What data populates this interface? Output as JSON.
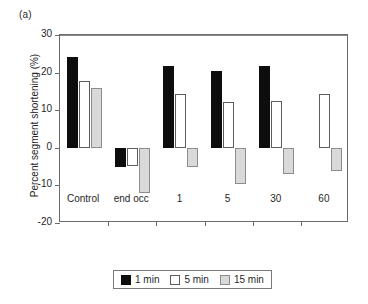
{
  "panel_label": "(a)",
  "chart_data": {
    "type": "bar",
    "title": "",
    "subtitle": "",
    "xlabel": "",
    "ylabel": "Percent segment shortening (%)",
    "ylim": [
      -20,
      30
    ],
    "yticks": [
      30,
      20,
      10,
      0,
      -10,
      -20
    ],
    "ytick_labels": [
      "30",
      "20",
      "10",
      "0",
      "-10",
      "-20"
    ],
    "grid": false,
    "legend_position": "bottom-center",
    "categories": [
      "Control",
      "end occ",
      "1",
      "5",
      "30",
      "60"
    ],
    "series": [
      {
        "name": "1 min",
        "color": "#0d0d0d",
        "values": [
          24.1,
          -5.1,
          21.7,
          20.5,
          21.8,
          null
        ]
      },
      {
        "name": "5 min",
        "color": "#ffffff",
        "values": [
          17.8,
          -4.8,
          14.3,
          12.1,
          12.4,
          14.2
        ]
      },
      {
        "name": "15 min",
        "color": "#d9d9d9",
        "values": [
          15.9,
          -12.1,
          -5.0,
          -9.6,
          -7.0,
          -6.3
        ]
      }
    ]
  },
  "legend": {
    "items": [
      {
        "label": "1 min",
        "swatch": "black-square-icon"
      },
      {
        "label": "5 min",
        "swatch": "white-square-icon"
      },
      {
        "label": "15 min",
        "swatch": "gray-square-icon"
      }
    ]
  }
}
